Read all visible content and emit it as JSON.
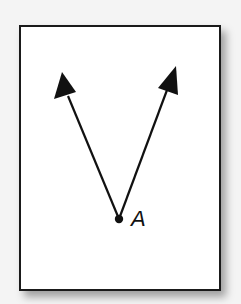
{
  "figure": {
    "type": "angle-diagram",
    "colors": {
      "background": "#f4f4f4",
      "card": "#ffffff",
      "stroke": "#111111"
    },
    "vertex": {
      "label": "A",
      "x": 119,
      "y": 219
    },
    "rays": [
      {
        "name": "left-ray",
        "to_x": 62,
        "to_y": 72
      },
      {
        "name": "right-ray",
        "to_x": 176,
        "to_y": 66
      }
    ]
  }
}
